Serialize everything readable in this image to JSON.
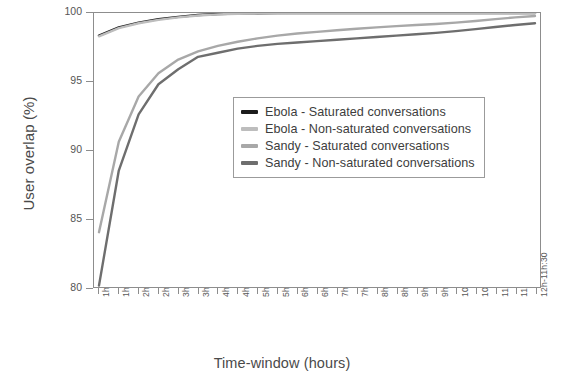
{
  "chart_data": {
    "type": "line",
    "title": "",
    "xlabel": "Time-window (hours)",
    "ylabel": "User overlap (%)",
    "ylim": [
      80,
      100
    ],
    "yticks": [
      80,
      85,
      90,
      95,
      100
    ],
    "grid": false,
    "legend_position": "upper-right-inside",
    "categories": [
      "1h-0h:30",
      "1h30-01h",
      "2h-01h:30",
      "2h30-02h",
      "3h-02h:30",
      "3h30-03h",
      "4h-03h:30",
      "4h30-04h",
      "5h-04h:30",
      "5h30-05h",
      "6h-05h:30",
      "6h30-06h",
      "7h-06h:30",
      "7h30-07h",
      "8h-07h:30",
      "8h30-08h",
      "9h-08h:30",
      "9h30-09h",
      "10h-09h:30",
      "10h30-10h",
      "11h-10h:30",
      "11h30-11h",
      "12h-11h:30"
    ],
    "series": [
      {
        "name": "Ebola - Saturated conversations",
        "color": "#1c1c1c",
        "values": [
          98.35,
          98.95,
          99.3,
          99.55,
          99.72,
          99.85,
          99.93,
          99.96,
          99.98,
          99.99,
          100,
          100,
          100,
          100,
          100,
          100,
          100,
          100,
          100,
          100,
          100,
          100,
          100
        ]
      },
      {
        "name": "Ebola - Non-saturated conversations",
        "color": "#bdbdbd",
        "values": [
          98.3,
          98.9,
          99.25,
          99.5,
          99.68,
          99.82,
          99.9,
          99.94,
          99.97,
          99.98,
          99.99,
          100,
          100,
          100,
          100,
          100,
          100,
          100,
          100,
          100,
          100,
          100,
          100
        ]
      },
      {
        "name": "Sandy - Saturated conversations",
        "color": "#a8a8a8",
        "values": [
          84.0,
          90.6,
          93.9,
          95.6,
          96.6,
          97.2,
          97.6,
          97.9,
          98.15,
          98.35,
          98.5,
          98.62,
          98.74,
          98.85,
          98.95,
          99.04,
          99.12,
          99.2,
          99.3,
          99.42,
          99.55,
          99.68,
          99.78
        ]
      },
      {
        "name": "Sandy - Non-saturated conversations",
        "color": "#6e6e6e",
        "values": [
          80.1,
          88.5,
          92.6,
          94.8,
          95.9,
          96.8,
          97.1,
          97.4,
          97.6,
          97.75,
          97.85,
          97.95,
          98.05,
          98.15,
          98.25,
          98.35,
          98.45,
          98.55,
          98.68,
          98.82,
          98.98,
          99.12,
          99.25
        ]
      }
    ]
  }
}
